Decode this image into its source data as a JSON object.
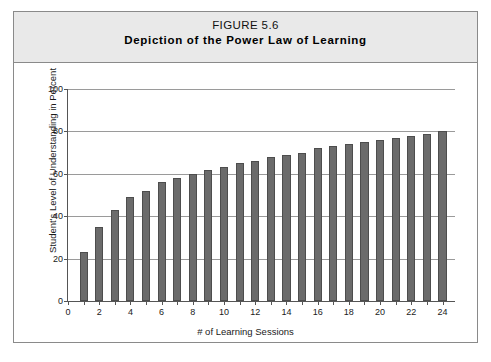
{
  "figure": {
    "number_label": "FIGURE 5.6",
    "caption": "Depiction of the Power Law of Learning"
  },
  "colors": {
    "bar_fill": "#6b6b6b",
    "bar_stroke": "#4d4d4d",
    "gridline": "#9a9a9a",
    "axis": "#555555",
    "header_band": "#e9e9e9",
    "frame_border": "#8a8a8a",
    "page_background": "#ffffff"
  },
  "chart_data": {
    "type": "bar",
    "title": "Depiction of the Power Law of Learning",
    "subtitle": "FIGURE 5.6",
    "xlabel": "# of Learning Sessions",
    "ylabel": "Student's Level of Understanding in Percent",
    "xlim": [
      0,
      24.8
    ],
    "ylim": [
      0,
      100
    ],
    "grid": true,
    "legend": null,
    "y_ticks": [
      0,
      20,
      40,
      60,
      80,
      100
    ],
    "y_tick_labels": [
      "0",
      "20",
      "40",
      "60",
      "80",
      "100"
    ],
    "x_ticks": [
      0,
      1,
      2,
      3,
      4,
      5,
      6,
      7,
      8,
      9,
      10,
      11,
      12,
      13,
      14,
      15,
      16,
      17,
      18,
      19,
      20,
      21,
      22,
      23,
      24
    ],
    "x_tick_labels": [
      "0",
      "",
      "2",
      "",
      "4",
      "",
      "6",
      "",
      "8",
      "",
      "10",
      "",
      "12",
      "",
      "14",
      "",
      "16",
      "",
      "18",
      "",
      "20",
      "",
      "22",
      "",
      "24"
    ],
    "categories": [
      1,
      2,
      3,
      4,
      5,
      6,
      7,
      8,
      9,
      10,
      11,
      12,
      13,
      14,
      15,
      16,
      17,
      18,
      19,
      20,
      21,
      22,
      23,
      24
    ],
    "values": [
      23,
      35,
      43,
      49,
      52,
      56,
      58,
      60,
      62,
      63,
      65,
      66,
      68,
      69,
      70,
      72,
      73,
      74,
      75,
      76,
      77,
      78,
      79,
      80
    ],
    "bar_width_fraction": 0.52
  }
}
